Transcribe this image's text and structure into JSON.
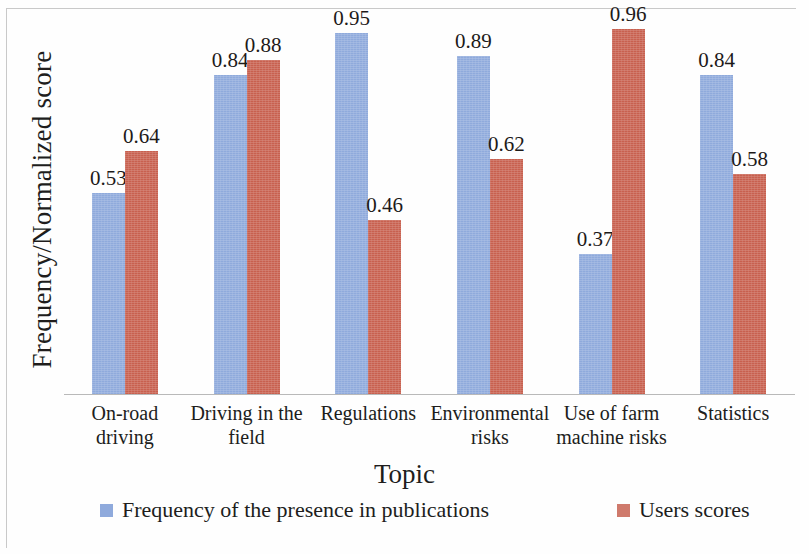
{
  "chart_data": {
    "type": "bar",
    "title": "",
    "xlabel": "Topic",
    "ylabel": "Frequency/Normalized score",
    "categories": [
      "On-road driving",
      "Driving in the field",
      "Regulations",
      "Environmental risks",
      "Use of farm machine risks",
      "Statistics"
    ],
    "category_lines": [
      [
        "On-road",
        "driving"
      ],
      [
        "Driving in the",
        "field"
      ],
      [
        "Regulations"
      ],
      [
        "Environmental",
        "risks"
      ],
      [
        "Use of farm",
        "machine risks"
      ],
      [
        "Statistics"
      ]
    ],
    "series": [
      {
        "name": "Frequency of the presence in publications",
        "color": "#8faadc",
        "values": [
          0.53,
          0.84,
          0.95,
          0.89,
          0.37,
          0.84
        ],
        "labels": [
          "0.53",
          "0.84",
          "0.95",
          "0.89",
          "0.37",
          "0.84"
        ]
      },
      {
        "name": "Users scores",
        "color": "#c8604f",
        "values": [
          0.64,
          0.88,
          0.46,
          0.62,
          0.96,
          0.58
        ],
        "labels": [
          "0.64",
          "0.88",
          "0.46",
          "0.62",
          "0.96",
          "0.58"
        ]
      }
    ],
    "ylim": [
      0,
      1.0
    ],
    "grid": false,
    "y_axis_ticks_visible": false,
    "legend_position": "bottom",
    "data_labels_shown": true
  },
  "legend": {
    "items": [
      {
        "label": "Frequency of the presence in publications",
        "color": "#8faadc"
      },
      {
        "label": "Users scores",
        "color": "#cf7a6c"
      }
    ]
  },
  "axes": {
    "x_title": "Topic",
    "y_title": "Frequency/Normalized score"
  }
}
